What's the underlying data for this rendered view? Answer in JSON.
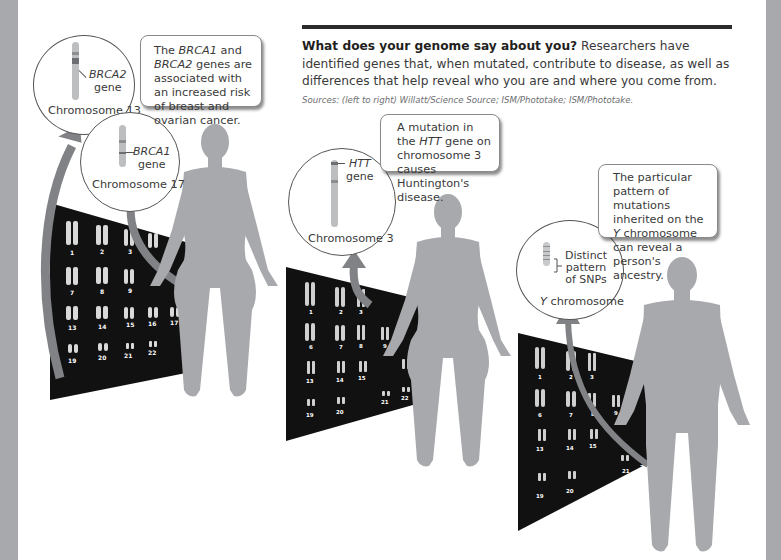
{
  "caption": {
    "lead": "What does your genome say about you?",
    "body": " Researchers have identified genes that, when mutated, contribute to disease, as well as differences that help reveal who you are and where you come from. ",
    "credit": "Sources: (left to right) Willatt/Science Source; ISM/Phototake; ISM/Phototake."
  },
  "panels": [
    {
      "id": "brca",
      "callout": {
        "parts": [
          "The ",
          "BRCA1",
          " and ",
          "BRCA2",
          " genes are associated with an increased risk of breast and ovarian cancer."
        ]
      },
      "circles": [
        {
          "gene_name": "BRCA2",
          "gene_word": "gene",
          "chromosome_label": "Chromosome 13"
        },
        {
          "gene_name": "BRCA1",
          "gene_word": "gene",
          "chromosome_label": "Chromosome 17"
        }
      ],
      "figure": "female-silhouette",
      "karyotype_numbers": [
        "1",
        "2",
        "3",
        "4",
        "5",
        "6",
        "7",
        "8",
        "9",
        "10",
        "11",
        "12",
        "13",
        "14",
        "15",
        "16",
        "17",
        "18",
        "19",
        "20",
        "21",
        "22",
        "X"
      ]
    },
    {
      "id": "htt",
      "callout": {
        "parts": [
          "A mutation in the ",
          "HTT",
          " gene on chromosome 3 causes Huntington's disease."
        ]
      },
      "circles": [
        {
          "gene_name": "HTT",
          "gene_word": "gene",
          "chromosome_label": "Chromosome 3"
        }
      ],
      "figure": "female-silhouette",
      "karyotype_numbers": [
        "1",
        "2",
        "3",
        "4",
        "5",
        "6",
        "7",
        "8",
        "9",
        "10",
        "11",
        "12",
        "13",
        "14",
        "15",
        "16",
        "17",
        "18",
        "19",
        "20",
        "21",
        "22",
        "X"
      ]
    },
    {
      "id": "ychrom",
      "callout": {
        "parts": [
          "The particular pattern of mutations inherited on the ",
          "Y",
          " chromosome can reveal a person's ancestry."
        ]
      },
      "circles": [
        {
          "gene_name": "Distinct pattern of SNPs",
          "gene_lines": [
            "Distinct",
            "pattern",
            "of SNPs"
          ],
          "chromosome_italic": "Y",
          "chromosome_rest": " chromosome"
        }
      ],
      "figure": "male-silhouette",
      "karyotype_numbers": [
        "1",
        "2",
        "3",
        "4",
        "5",
        "6",
        "7",
        "8",
        "9",
        "10",
        "11",
        "12",
        "13",
        "14",
        "15",
        "16",
        "17",
        "18",
        "19",
        "20",
        "21",
        "22",
        "X",
        "Y"
      ]
    }
  ],
  "colors": {
    "silhouette": "#a7a9ac",
    "arrow": "#808285",
    "karyotype_bg": "#111111",
    "side_strip": "#a7a9ac",
    "header_bar": "#2b2b2b"
  }
}
